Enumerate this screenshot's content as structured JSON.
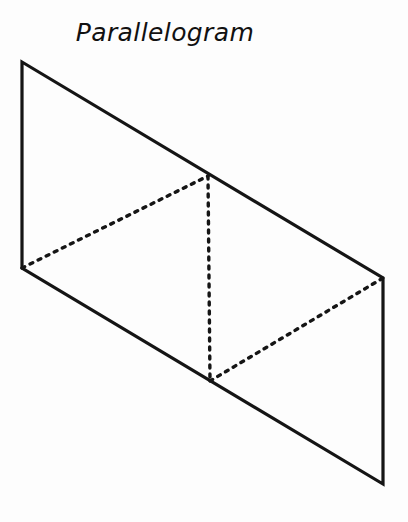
{
  "page": {
    "width": 408,
    "height": 522,
    "background_color": "#fdfdfd"
  },
  "figure": {
    "title": "Parallelogram",
    "title_style": "handwritten-italic",
    "ink_color": "#151515",
    "solid_stroke_width": 3.2,
    "dashed_stroke_width": 3.4,
    "dash_pattern": "3 6",
    "outline": {
      "name": "parallelogram-outline",
      "type": "solid",
      "vertices": [
        {
          "label": "top-left",
          "x": 22,
          "y": 62
        },
        {
          "label": "top-right",
          "x": 383,
          "y": 278
        },
        {
          "label": "bottom-right",
          "x": 383,
          "y": 484
        },
        {
          "label": "bottom-left",
          "x": 22,
          "y": 268
        }
      ],
      "points": "22,62 383,278 383,484 22,268"
    },
    "construction_lines": [
      {
        "name": "diagonal-upper-left",
        "type": "dashed",
        "from": {
          "x": 22,
          "y": 268
        },
        "to": {
          "x": 208,
          "y": 176
        }
      },
      {
        "name": "altitude-vertical",
        "type": "dashed",
        "from": {
          "x": 208,
          "y": 176
        },
        "to": {
          "x": 210,
          "y": 381
        }
      },
      {
        "name": "diagonal-lower-right",
        "type": "dashed",
        "from": {
          "x": 210,
          "y": 381
        },
        "to": {
          "x": 383,
          "y": 278
        }
      }
    ]
  }
}
